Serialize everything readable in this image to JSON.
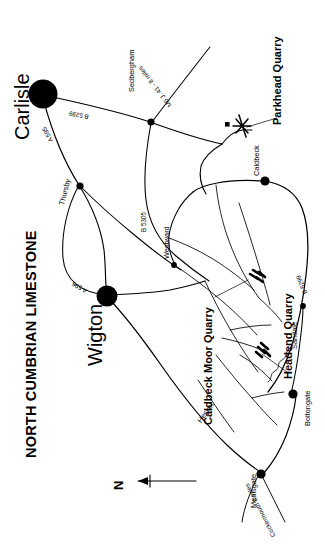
{
  "figure": {
    "title": "NORTH CUMBRIAN LIMESTONE",
    "orientation_note": "N",
    "background_color": "#ffffff",
    "ink_color": "#000000"
  },
  "towns": [
    {
      "name": "Carlisle",
      "rank": "major"
    },
    {
      "name": "Wigton",
      "rank": "major"
    },
    {
      "name": "Thursby",
      "rank": "minor"
    },
    {
      "name": "Sedbergham",
      "rank": "minor"
    },
    {
      "name": "Westward",
      "rank": "minor"
    },
    {
      "name": "Caldbeck",
      "rank": "minor"
    },
    {
      "name": "Sandale",
      "rank": "minor"
    },
    {
      "name": "Boltongate",
      "rank": "minor"
    },
    {
      "name": "Mealsgate",
      "rank": "minor"
    },
    {
      "name": "Hesket",
      "rank": "minor"
    }
  ],
  "quarries": [
    {
      "name": "Parkhead Quarry"
    },
    {
      "name": "Caldbeck Moor Quarry"
    },
    {
      "name": "Headend Quarry"
    }
  ],
  "roads": [
    {
      "number": "B 5299"
    },
    {
      "number": "A 595"
    },
    {
      "number": "A 596"
    },
    {
      "number": "B 5305"
    },
    {
      "number": "B 5299"
    }
  ],
  "annotations": [
    {
      "text": "M6 J. 41 - 8 miles"
    },
    {
      "text": "Cockermouth 8 miles"
    }
  ]
}
